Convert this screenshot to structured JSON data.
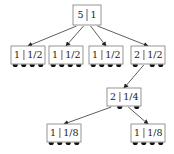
{
  "diagram": {
    "type": "tree",
    "colors": {
      "box_border": "#8a8a8a",
      "edge": "#333333",
      "dot": "#111111",
      "text": "#222222"
    },
    "nodes": [
      {
        "id": "root",
        "left": "5",
        "right": "1",
        "x": 73,
        "y": 5,
        "w": 28,
        "h": 20,
        "ports": 4,
        "dot_ports": []
      },
      {
        "id": "leaf-a",
        "left": "1",
        "right": "1/2",
        "x": 11,
        "y": 46,
        "w": 34,
        "h": 18,
        "ports": 4,
        "dot_ports": [
          0,
          1,
          2,
          3
        ]
      },
      {
        "id": "leaf-b",
        "left": "1",
        "right": "1/2",
        "x": 49,
        "y": 46,
        "w": 34,
        "h": 18,
        "ports": 4,
        "dot_ports": [
          0,
          1,
          2,
          3
        ]
      },
      {
        "id": "leaf-c",
        "left": "1",
        "right": "1/2",
        "x": 89,
        "y": 46,
        "w": 34,
        "h": 18,
        "ports": 4,
        "dot_ports": [
          0,
          1,
          2,
          3
        ]
      },
      {
        "id": "inner-d",
        "left": "2",
        "right": "1/2",
        "x": 131,
        "y": 46,
        "w": 34,
        "h": 18,
        "ports": 4,
        "dot_ports": [
          0,
          2,
          3
        ]
      },
      {
        "id": "inner-e",
        "left": "2",
        "right": "1/4",
        "x": 107,
        "y": 88,
        "w": 34,
        "h": 18,
        "ports": 4,
        "dot_ports": [
          1,
          3
        ]
      },
      {
        "id": "leaf-f",
        "left": "1",
        "right": "1/8",
        "x": 47,
        "y": 124,
        "w": 34,
        "h": 18,
        "ports": 4,
        "dot_ports": [
          0,
          1,
          2,
          3
        ]
      },
      {
        "id": "leaf-g",
        "left": "1",
        "right": "1/8",
        "x": 131,
        "y": 124,
        "w": 34,
        "h": 18,
        "ports": 4,
        "dot_ports": [
          0,
          1,
          2,
          3
        ]
      }
    ],
    "edges": [
      {
        "from": "root",
        "port": 0,
        "to": "leaf-a"
      },
      {
        "from": "root",
        "port": 1,
        "to": "leaf-b"
      },
      {
        "from": "root",
        "port": 2,
        "to": "leaf-c"
      },
      {
        "from": "root",
        "port": 3,
        "to": "inner-d"
      },
      {
        "from": "inner-d",
        "port": 1,
        "to": "inner-e"
      },
      {
        "from": "inner-e",
        "port": 0,
        "to": "leaf-f"
      },
      {
        "from": "inner-e",
        "port": 2,
        "to": "leaf-g"
      }
    ]
  }
}
